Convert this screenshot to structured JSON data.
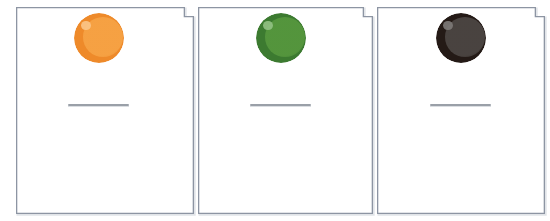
{
  "canvas": {
    "width": 550,
    "height": 221,
    "background": "#ffffff"
  },
  "style": {
    "card_border_color": "#8d95a3",
    "card_border_width": 1.3,
    "card_fill": "#ffffff",
    "card_shadow_color": "#c9ced6",
    "rule_color": "#9aa0a8",
    "notch_size": 9
  },
  "worksheet": {
    "title": "",
    "card_count": 3,
    "cards": [
      {
        "id": "card-1",
        "index": 1,
        "label": "",
        "x": 16,
        "y": 7,
        "width": 178,
        "height": 207,
        "ball": {
          "name": "orange-ball",
          "color_label": "orange",
          "rim_color": "#ee8a2a",
          "core_color": "#f6a244",
          "highlight_color": "#fbc689",
          "diameter": 50,
          "center_x": 99,
          "center_y": 38
        },
        "answer_line": {
          "name": "answer-line",
          "value": "",
          "x": 68,
          "y": 104,
          "width": 61
        }
      },
      {
        "id": "card-2",
        "index": 2,
        "label": "",
        "x": 198,
        "y": 7,
        "width": 175,
        "height": 207,
        "ball": {
          "name": "green-ball",
          "color_label": "green",
          "rim_color": "#3c7a30",
          "core_color": "#55963d",
          "highlight_color": "#93c184",
          "diameter": 50,
          "center_x": 281,
          "center_y": 38
        },
        "answer_line": {
          "name": "answer-line",
          "value": "",
          "x": 250,
          "y": 104,
          "width": 61
        }
      },
      {
        "id": "card-3",
        "index": 3,
        "label": "",
        "x": 377,
        "y": 7,
        "width": 168,
        "height": 207,
        "ball": {
          "name": "black-ball",
          "color_label": "black",
          "rim_color": "#241a16",
          "core_color": "#4b4542",
          "highlight_color": "#7e7a78",
          "diameter": 50,
          "center_x": 461,
          "center_y": 38
        },
        "answer_line": {
          "name": "answer-line",
          "value": "",
          "x": 430,
          "y": 104,
          "width": 61
        }
      }
    ]
  }
}
